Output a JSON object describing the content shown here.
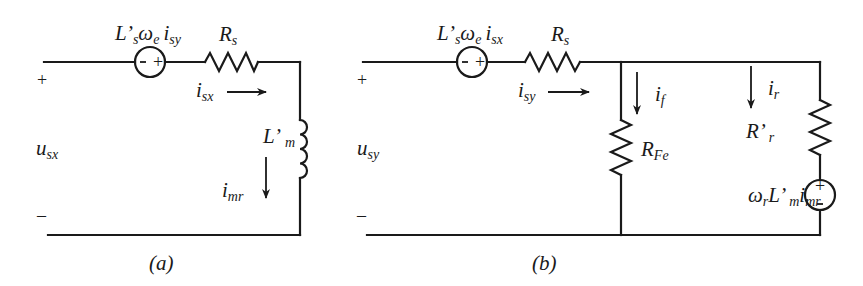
{
  "figure": {
    "panel_a": {
      "caption": "(a)",
      "terminal_plus": "+",
      "terminal_minus": "–",
      "voltage": {
        "main": "u",
        "sub": "sx"
      },
      "source_label": {
        "L": "L",
        "prime": "’",
        "s": "s",
        "omega": "ω",
        "e": "e",
        "i": "i",
        "sub": "sy"
      },
      "source_polarity": {
        "left": "–",
        "right": "+"
      },
      "resistor_label": {
        "main": "R",
        "sub": "s"
      },
      "current_series": {
        "main": "i",
        "sub": "sx"
      },
      "inductor_label": {
        "main": "L",
        "prime": "’",
        "sub": "m"
      },
      "current_magnetizing": {
        "main": "i",
        "sub": "mr"
      }
    },
    "panel_b": {
      "caption": "(b)",
      "terminal_plus": "+",
      "terminal_minus": "–",
      "voltage": {
        "main": "u",
        "sub": "sy"
      },
      "source_label": {
        "L": "L",
        "prime": "’",
        "s": "s",
        "omega": "ω",
        "e": "e",
        "i": "i",
        "sub": "sx"
      },
      "source_polarity": {
        "left": "–",
        "right": "+"
      },
      "resistor_label": {
        "main": "R",
        "sub": "s"
      },
      "current_series": {
        "main": "i",
        "sub": "sy"
      },
      "iron_current": {
        "main": "i",
        "sub": "f"
      },
      "iron_resistor": {
        "main": "R",
        "sub": "Fe"
      },
      "rotor_current": {
        "main": "i",
        "sub": "r"
      },
      "rotor_resistor": {
        "main": "R",
        "prime": "’",
        "sub": "r"
      },
      "rotor_source_label": {
        "omega": "ω",
        "r": "r",
        "L": "L",
        "prime": "’",
        "m": "m",
        "i": "i",
        "sub": "mr"
      },
      "rotor_source_polarity": {
        "top": "+",
        "bottom": "–"
      }
    },
    "colors": {
      "ink": "#1a1a1a",
      "background": "#ffffff"
    }
  }
}
